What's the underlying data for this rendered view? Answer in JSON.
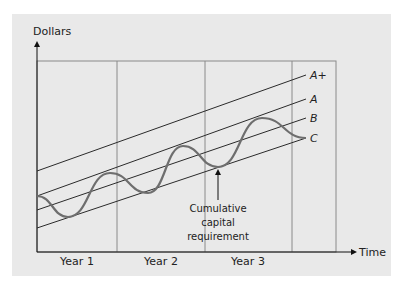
{
  "chart_data": {
    "type": "line",
    "title": "",
    "xlabel": "Time",
    "ylabel": "Dollars",
    "categories": [
      "Year 1",
      "Year 2",
      "Year 3"
    ],
    "lines": [
      {
        "name": "A+",
        "kind": "straight",
        "x1": 37,
        "y1": 171,
        "x2": 306,
        "y2": 75
      },
      {
        "name": "A",
        "kind": "straight",
        "x1": 37,
        "y1": 196,
        "x2": 306,
        "y2": 99
      },
      {
        "name": "B",
        "kind": "straight",
        "x1": 37,
        "y1": 210,
        "x2": 306,
        "y2": 118
      },
      {
        "name": "C",
        "kind": "straight",
        "x1": 37,
        "y1": 228,
        "x2": 306,
        "y2": 138
      }
    ],
    "series": [
      {
        "name": "Cumulative capital requirement",
        "kind": "wave",
        "points": [
          [
            37,
            196
          ],
          [
            68,
            217
          ],
          [
            110,
            173
          ],
          [
            148,
            193
          ],
          [
            183,
            146
          ],
          [
            218,
            167
          ],
          [
            262,
            118
          ],
          [
            306,
            138
          ]
        ]
      }
    ],
    "annotation": {
      "text_lines": [
        "Cumulative",
        "capital",
        "requirement"
      ],
      "arrow_x": 218,
      "arrow_y1": 200,
      "arrow_y2": 169
    },
    "grid": {
      "dividers_x": [
        117,
        205,
        292
      ],
      "frame": {
        "left": 37,
        "top": 61,
        "right": 336,
        "bottom": 252
      }
    },
    "colors": {
      "panel": "#e9e9e9",
      "lines": "#2a2a2a",
      "curve": "#6e6e6e",
      "frame": "#8a8a8a"
    }
  },
  "labels": {
    "y_axis": "Dollars",
    "x_axis": "Time",
    "years": [
      "Year 1",
      "Year 2",
      "Year 3"
    ],
    "line_labels": [
      "A+",
      "A",
      "B",
      "C"
    ],
    "annotation": [
      "Cumulative",
      "capital",
      "requirement"
    ]
  }
}
